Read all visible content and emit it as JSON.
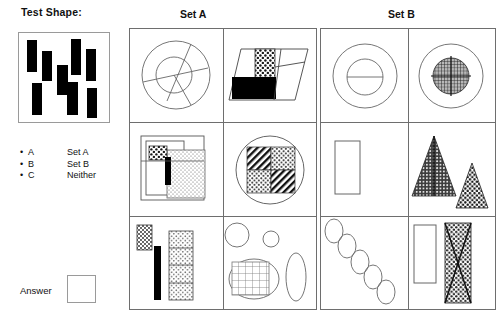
{
  "test_shape": {
    "title": "Test Shape:",
    "bars": [
      {
        "x": 8,
        "y": 7,
        "w": 10,
        "h": 32
      },
      {
        "x": 23,
        "y": 18,
        "w": 10,
        "h": 30
      },
      {
        "x": 38,
        "y": 32,
        "w": 11,
        "h": 30
      },
      {
        "x": 52,
        "y": 6,
        "w": 10,
        "h": 36
      },
      {
        "x": 67,
        "y": 16,
        "w": 10,
        "h": 32
      },
      {
        "x": 13,
        "y": 50,
        "w": 10,
        "h": 32
      },
      {
        "x": 48,
        "y": 49,
        "w": 11,
        "h": 33
      },
      {
        "x": 68,
        "y": 55,
        "w": 10,
        "h": 30
      }
    ]
  },
  "legend": {
    "items": [
      {
        "bullet": "•",
        "key": "A",
        "value": "Set A"
      },
      {
        "bullet": "•",
        "key": "B",
        "value": "Set B"
      },
      {
        "bullet": "•",
        "key": "C",
        "value": "Neither"
      }
    ]
  },
  "answer": {
    "label": "Answer",
    "value": ""
  },
  "sets": {
    "a": {
      "title": "Set A",
      "cells": [
        {
          "name": "concentric-circles-with-spokes",
          "description": "Large outline circle with smaller concentric inner circle crossed by diagonal spoke lines"
        },
        {
          "name": "parallelogram-with-black-and-dotted-rectangles",
          "description": "Outlined parallelogram containing a solid black rectangle and a coarse-dotted rectangle"
        },
        {
          "name": "overlapping-textured-rectangles",
          "description": "Several overlapping outlined rectangles with dotted and stippled fills plus a narrow black bar"
        },
        {
          "name": "circle-with-four-patterned-quadrants",
          "description": "Outline circle containing a 2x2 block of diagonal-hatch and stippled squares"
        },
        {
          "name": "stippled-bars-and-segmented-column",
          "description": "A stippled narrow rectangle, a solid black bar, and a tall rectangle split into four stippled segments"
        },
        {
          "name": "circles-ellipses-and-grid-ellipse",
          "description": "Two plain circles, a tall plain ellipse, and a grid-filled ellipse"
        }
      ]
    },
    "b": {
      "title": "Set B",
      "cells": [
        {
          "name": "circle-with-bisected-inner-circle",
          "description": "Outline circle with concentric inner circle bisected by a horizontal line"
        },
        {
          "name": "circle-with-crosshatch-inner-disc",
          "description": "Outline circle with a cross-hatch filled inner disc crossed by vertical and horizontal lines"
        },
        {
          "name": "single-empty-rectangle",
          "description": "One plain outlined vertical rectangle"
        },
        {
          "name": "two-stippled-triangles",
          "description": "A large dark-stippled triangle with a vertical centre line and a smaller light-stippled triangle"
        },
        {
          "name": "diagonal-chain-of-ellipses",
          "description": "Five outlined ellipses arranged along a descending diagonal"
        },
        {
          "name": "rectangle-and-bowtie-rectangle",
          "description": "A plain outlined rectangle beside a stippled rectangle overlaid with a bowtie X"
        }
      ]
    }
  },
  "colors": {
    "ink": "#000000",
    "outline": "#6e6e6e",
    "light_outline": "#9a9a9a",
    "background": "#ffffff",
    "dark_fill": "#4a4a4a"
  }
}
